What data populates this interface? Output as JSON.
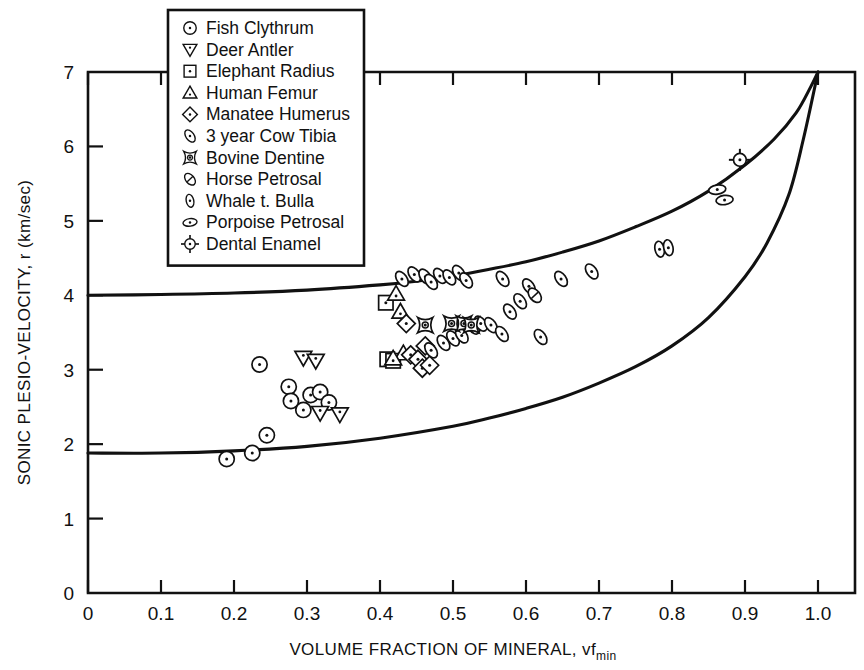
{
  "chart_data": {
    "type": "scatter",
    "title": "",
    "xlabel": "VOLUME FRACTION OF MINERAL, vf",
    "xlabel_sub": "min",
    "ylabel": "SONIC PLESIO-VELOCITY, r  (km/sec)",
    "xlim": [
      0,
      1.05
    ],
    "ylim": [
      0,
      7
    ],
    "xticks": [
      "0",
      "0.1",
      "0.2",
      "0.3",
      "0.4",
      "0.5",
      "0.6",
      "0.7",
      "0.8",
      "0.9",
      "1.0"
    ],
    "xtick_values": [
      0,
      0.1,
      0.2,
      0.3,
      0.4,
      0.5,
      0.6,
      0.7,
      0.8,
      0.9,
      1.0
    ],
    "yticks": [
      "0",
      "1",
      "2",
      "3",
      "4",
      "5",
      "6",
      "7"
    ],
    "ytick_values": [
      0,
      1,
      2,
      3,
      4,
      5,
      6,
      7
    ],
    "grid": false,
    "legend_position": "top-left-inside",
    "bound_curves": [
      {
        "name": "upper-bound",
        "points": [
          [
            0.0,
            4.0
          ],
          [
            0.1,
            4.01
          ],
          [
            0.2,
            4.03
          ],
          [
            0.3,
            4.07
          ],
          [
            0.4,
            4.14
          ],
          [
            0.45,
            4.19
          ],
          [
            0.5,
            4.26
          ],
          [
            0.55,
            4.35
          ],
          [
            0.6,
            4.45
          ],
          [
            0.65,
            4.58
          ],
          [
            0.7,
            4.73
          ],
          [
            0.75,
            4.92
          ],
          [
            0.8,
            5.13
          ],
          [
            0.85,
            5.4
          ],
          [
            0.9,
            5.75
          ],
          [
            0.94,
            6.1
          ],
          [
            0.97,
            6.45
          ],
          [
            0.99,
            6.8
          ],
          [
            1.0,
            7.0
          ]
        ]
      },
      {
        "name": "lower-bound",
        "points": [
          [
            0.0,
            1.88
          ],
          [
            0.1,
            1.88
          ],
          [
            0.2,
            1.91
          ],
          [
            0.3,
            1.97
          ],
          [
            0.4,
            2.08
          ],
          [
            0.5,
            2.24
          ],
          [
            0.55,
            2.35
          ],
          [
            0.6,
            2.48
          ],
          [
            0.65,
            2.63
          ],
          [
            0.7,
            2.82
          ],
          [
            0.75,
            3.04
          ],
          [
            0.8,
            3.32
          ],
          [
            0.85,
            3.7
          ],
          [
            0.9,
            4.25
          ],
          [
            0.93,
            4.7
          ],
          [
            0.96,
            5.35
          ],
          [
            0.98,
            6.1
          ],
          [
            1.0,
            7.0
          ]
        ]
      }
    ],
    "series": [
      {
        "name": "Fish Clythrum",
        "marker": "circle-dot",
        "points": [
          [
            0.19,
            1.8
          ],
          [
            0.225,
            1.88
          ],
          [
            0.235,
            3.07
          ],
          [
            0.245,
            2.12
          ],
          [
            0.275,
            2.77
          ],
          [
            0.278,
            2.58
          ],
          [
            0.305,
            2.66
          ],
          [
            0.318,
            2.7
          ],
          [
            0.33,
            2.56
          ],
          [
            0.295,
            2.46
          ]
        ]
      },
      {
        "name": "Deer Antler",
        "marker": "triangle-down",
        "points": [
          [
            0.295,
            3.16
          ],
          [
            0.312,
            3.12
          ],
          [
            0.318,
            2.42
          ],
          [
            0.345,
            2.4
          ]
        ]
      },
      {
        "name": "Elephant Radius",
        "marker": "square-dot",
        "points": [
          [
            0.408,
            3.9
          ],
          [
            0.41,
            3.14
          ],
          [
            0.418,
            3.12
          ]
        ]
      },
      {
        "name": "Human Femur",
        "marker": "triangle-up",
        "points": [
          [
            0.422,
            4.02
          ],
          [
            0.428,
            3.78
          ],
          [
            0.432,
            3.22
          ],
          [
            0.418,
            3.15
          ]
        ]
      },
      {
        "name": "Manatee Humerus",
        "marker": "diamond-dot",
        "points": [
          [
            0.436,
            3.62
          ],
          [
            0.442,
            3.2
          ],
          [
            0.452,
            3.14
          ],
          [
            0.458,
            3.02
          ],
          [
            0.468,
            3.06
          ],
          [
            0.462,
            3.32
          ]
        ]
      },
      {
        "name": "3 year Cow Tibia",
        "marker": "ellipse",
        "points": [
          [
            0.43,
            4.22
          ],
          [
            0.447,
            4.28
          ],
          [
            0.462,
            4.25
          ],
          [
            0.47,
            4.18
          ],
          [
            0.482,
            4.26
          ],
          [
            0.495,
            4.24
          ],
          [
            0.508,
            4.3
          ],
          [
            0.518,
            4.2
          ],
          [
            0.47,
            3.26
          ],
          [
            0.487,
            3.36
          ],
          [
            0.5,
            3.42
          ],
          [
            0.512,
            3.46
          ],
          [
            0.528,
            3.58
          ],
          [
            0.538,
            3.62
          ],
          [
            0.552,
            3.6
          ],
          [
            0.567,
            3.48
          ],
          [
            0.578,
            3.78
          ],
          [
            0.592,
            3.92
          ],
          [
            0.604,
            4.12
          ],
          [
            0.568,
            4.22
          ],
          [
            0.62,
            3.44
          ],
          [
            0.648,
            4.22
          ],
          [
            0.69,
            4.32
          ]
        ]
      },
      {
        "name": "Bovine Dentine",
        "marker": "spool",
        "points": [
          [
            0.462,
            3.6
          ],
          [
            0.498,
            3.62
          ],
          [
            0.515,
            3.62
          ],
          [
            0.525,
            3.6
          ]
        ]
      },
      {
        "name": "Horse Petrosal",
        "marker": "ellipse-slash",
        "points": [
          [
            0.612,
            4.0
          ]
        ]
      },
      {
        "name": "Whale t. Bulla",
        "marker": "ellipse-vertical",
        "points": [
          [
            0.783,
            4.62
          ],
          [
            0.795,
            4.64
          ]
        ]
      },
      {
        "name": "Porpoise Petrosal",
        "marker": "ellipse-flat",
        "points": [
          [
            0.862,
            5.42
          ],
          [
            0.872,
            5.28
          ]
        ]
      },
      {
        "name": "Dental Enamel",
        "marker": "crosshair-circle",
        "points": [
          [
            0.893,
            5.82
          ]
        ]
      }
    ]
  },
  "legend": {
    "items": [
      {
        "label": "Fish Clythrum",
        "marker": "circle-dot"
      },
      {
        "label": "Deer Antler",
        "marker": "triangle-down"
      },
      {
        "label": "Elephant Radius",
        "marker": "square-dot"
      },
      {
        "label": "Human Femur",
        "marker": "triangle-up"
      },
      {
        "label": "Manatee Humerus",
        "marker": "diamond-dot"
      },
      {
        "label": "3 year Cow Tibia",
        "marker": "ellipse"
      },
      {
        "label": "Bovine Dentine",
        "marker": "spool"
      },
      {
        "label": "Horse Petrosal",
        "marker": "ellipse-slash"
      },
      {
        "label": "Whale t. Bulla",
        "marker": "ellipse-vertical"
      },
      {
        "label": "Porpoise Petrosal",
        "marker": "ellipse-flat"
      },
      {
        "label": "Dental Enamel",
        "marker": "crosshair-circle"
      }
    ]
  },
  "colors": {
    "ink": "#111111",
    "background": "#ffffff"
  }
}
